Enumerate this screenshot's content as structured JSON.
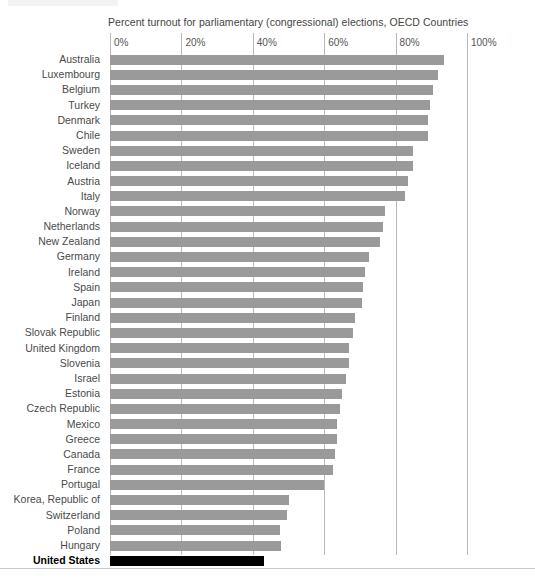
{
  "chart_data": {
    "type": "bar",
    "orientation": "horizontal",
    "title": "Percent turnout for parliamentary (congressional) elections, OECD Countries",
    "xlabel": "",
    "ylabel": "",
    "xlim": [
      0,
      100
    ],
    "xtick_labels": [
      "0%",
      "20%",
      "40%",
      "60%",
      "80%",
      "100%"
    ],
    "xticks": [
      0,
      20,
      40,
      60,
      80,
      100
    ],
    "grid": true,
    "legend": "none",
    "bar_color": "#9a9a9a",
    "highlight_color": "#000000",
    "highlight_category": "United States",
    "categories": [
      "Australia",
      "Luxembourg",
      "Belgium",
      "Turkey",
      "Denmark",
      "Chile",
      "Sweden",
      "Iceland",
      "Austria",
      "Italy",
      "Norway",
      "Netherlands",
      "New Zealand",
      "Germany",
      "Ireland",
      "Spain",
      "Japan",
      "Finland",
      "Slovak Republic",
      "United Kingdom",
      "Slovenia",
      "Israel",
      "Estonia",
      "Czech Republic",
      "Mexico",
      "Greece",
      "Canada",
      "France",
      "Portugal",
      "Korea, Republic of",
      "Switzerland",
      "Poland",
      "Hungary",
      "United States"
    ],
    "values": [
      93.5,
      92.0,
      90.5,
      89.5,
      89.0,
      89.0,
      85.0,
      85.0,
      83.5,
      82.5,
      77.0,
      76.5,
      75.5,
      72.5,
      71.5,
      71.0,
      70.5,
      68.5,
      68.0,
      67.0,
      67.0,
      66.0,
      65.0,
      64.5,
      63.5,
      63.5,
      63.0,
      62.5,
      60.0,
      50.0,
      49.5,
      47.5,
      48.0,
      43.0
    ]
  }
}
